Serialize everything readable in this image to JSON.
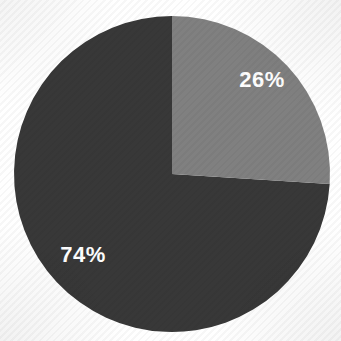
{
  "chart_data": {
    "type": "pie",
    "title": "",
    "subtitle": "",
    "xlabel": "",
    "ylabel": "",
    "grid": false,
    "legend": "none",
    "start_angle_deg": 0,
    "direction": "clockwise",
    "categories": [
      "Segment 1",
      "Segment 2"
    ],
    "values": [
      26,
      74
    ],
    "units": "%",
    "slices": [
      {
        "label": "26%",
        "value": 26,
        "color": "#808080",
        "label_color": "#ffffff",
        "start_angle_deg": 0,
        "end_angle_deg": 93.6,
        "label_x": 262,
        "label_y": 81
      },
      {
        "label": "74%",
        "value": 74,
        "color": "#383838",
        "label_color": "#ffffff",
        "start_angle_deg": 93.6,
        "end_angle_deg": 360,
        "label_x": 83,
        "label_y": 256
      }
    ]
  },
  "figure": {
    "background_color": "#ffffff",
    "center_x": 172,
    "center_y": 174,
    "radius": 158
  }
}
